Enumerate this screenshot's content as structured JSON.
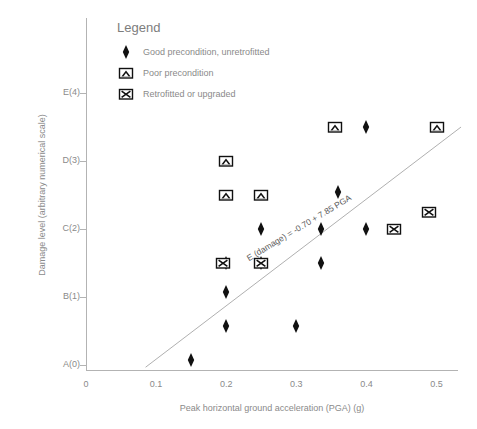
{
  "chart_data": {
    "type": "scatter",
    "title": "",
    "xlabel": "Peak horizontal ground acceleration (PGA) (g)",
    "ylabel": "Damage level (arbitrary numerical scale)",
    "xlim": [
      0,
      0.535
    ],
    "ylim": [
      0,
      4.5
    ],
    "grid": false,
    "xticks": [
      "0",
      "0.1",
      "0.2",
      "0.3",
      "0.4",
      "0.5"
    ],
    "xtick_values": [
      0,
      0.1,
      0.2,
      0.3,
      0.4,
      0.5
    ],
    "yticks": [
      "A(0)",
      "B(1)",
      "C(2)",
      "D(3)",
      "E(4)"
    ],
    "ytick_values": [
      0,
      1,
      2,
      3,
      4
    ],
    "legend": {
      "title": "Legend",
      "position": "upper-left-inside",
      "entries": [
        {
          "marker": "filled-diamond",
          "label": "Good precondition, unretrofitted"
        },
        {
          "marker": "square-chevron",
          "label": "Poor precondition"
        },
        {
          "marker": "square-x",
          "label": "Retrofitted or upgraded"
        }
      ]
    },
    "annotation": {
      "text": "E (damage) = -0.70 + 7.85 PGA",
      "x": 0.3,
      "y": 2.15,
      "rotation_deg": -31
    },
    "trend_line": {
      "slope": 7.85,
      "intercept": -0.7,
      "x_start": 0.085,
      "x_end": 0.535,
      "color": "#b0b0b0"
    },
    "series": [
      {
        "name": "Good precondition, unretrofitted",
        "marker": "filled-diamond",
        "points": [
          {
            "x": 0.15,
            "y": 0.07
          },
          {
            "x": 0.2,
            "y": 0.57
          },
          {
            "x": 0.2,
            "y": 1.07
          },
          {
            "x": 0.2,
            "y": 1.5
          },
          {
            "x": 0.25,
            "y": 1.5
          },
          {
            "x": 0.25,
            "y": 2.0
          },
          {
            "x": 0.3,
            "y": 0.57
          },
          {
            "x": 0.335,
            "y": 1.5
          },
          {
            "x": 0.335,
            "y": 2.0
          },
          {
            "x": 0.36,
            "y": 2.55
          },
          {
            "x": 0.4,
            "y": 2.0
          },
          {
            "x": 0.4,
            "y": 3.5
          }
        ]
      },
      {
        "name": "Poor precondition",
        "marker": "square-chevron",
        "points": [
          {
            "x": 0.2,
            "y": 3.0
          },
          {
            "x": 0.2,
            "y": 2.5
          },
          {
            "x": 0.25,
            "y": 2.5
          },
          {
            "x": 0.355,
            "y": 3.5
          },
          {
            "x": 0.5,
            "y": 3.5
          }
        ]
      },
      {
        "name": "Retrofitted or upgraded",
        "marker": "square-x",
        "points": [
          {
            "x": 0.195,
            "y": 1.5
          },
          {
            "x": 0.25,
            "y": 1.5
          },
          {
            "x": 0.44,
            "y": 2.0
          },
          {
            "x": 0.49,
            "y": 2.25
          }
        ]
      }
    ]
  }
}
